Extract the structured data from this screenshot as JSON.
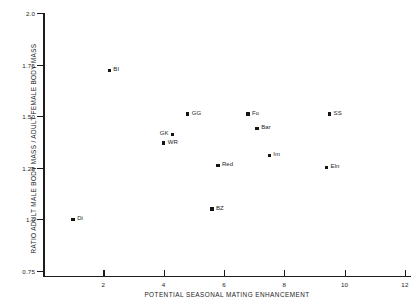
{
  "chart_data": {
    "type": "scatter",
    "title": "",
    "xlabel": "POTENTIAL SEASONAL MATING ENHANCEMENT",
    "ylabel": "RATIO ADULT MALE BODY MASS / ADULT FEMALE BODY MASS",
    "xlim": [
      0,
      12.2
    ],
    "ylim": [
      0.72,
      2.0
    ],
    "grid": false,
    "legend": "none",
    "xticks": [
      2,
      4,
      6,
      8,
      10,
      12
    ],
    "xtick_labels": [
      "2",
      "4",
      "6",
      "8",
      "10",
      "12"
    ],
    "yticks": [
      0.75,
      1.0,
      1.25,
      1.5,
      1.75,
      2.0
    ],
    "ytick_labels": [
      "0.75",
      "1.0",
      "1.25",
      "1.50",
      "1.75",
      "2.0"
    ],
    "marker_color": "#141414",
    "axis_color": "#1c1c1c",
    "background_color": "#ffffff",
    "points": [
      {
        "label": "Di",
        "x": 1.0,
        "y": 1.0,
        "label_side": "right"
      },
      {
        "label": "BI",
        "x": 2.2,
        "y": 1.72,
        "label_side": "right"
      },
      {
        "label": "WR",
        "x": 4.0,
        "y": 1.37,
        "label_side": "right"
      },
      {
        "label": "GK",
        "x": 4.3,
        "y": 1.41,
        "label_side": "left"
      },
      {
        "label": "GG",
        "x": 4.8,
        "y": 1.51,
        "label_side": "right"
      },
      {
        "label": "BZ",
        "x": 5.6,
        "y": 1.05,
        "label_side": "right"
      },
      {
        "label": "Red",
        "x": 5.8,
        "y": 1.26,
        "label_side": "right"
      },
      {
        "label": "Fo",
        "x": 6.8,
        "y": 1.51,
        "label_side": "right"
      },
      {
        "label": "Bar",
        "x": 7.1,
        "y": 1.44,
        "label_side": "right"
      },
      {
        "label": "Im",
        "x": 7.5,
        "y": 1.31,
        "label_side": "right"
      },
      {
        "label": "SS",
        "x": 9.5,
        "y": 1.51,
        "label_side": "right"
      },
      {
        "label": "Eln",
        "x": 9.4,
        "y": 1.25,
        "label_side": "right"
      }
    ]
  }
}
